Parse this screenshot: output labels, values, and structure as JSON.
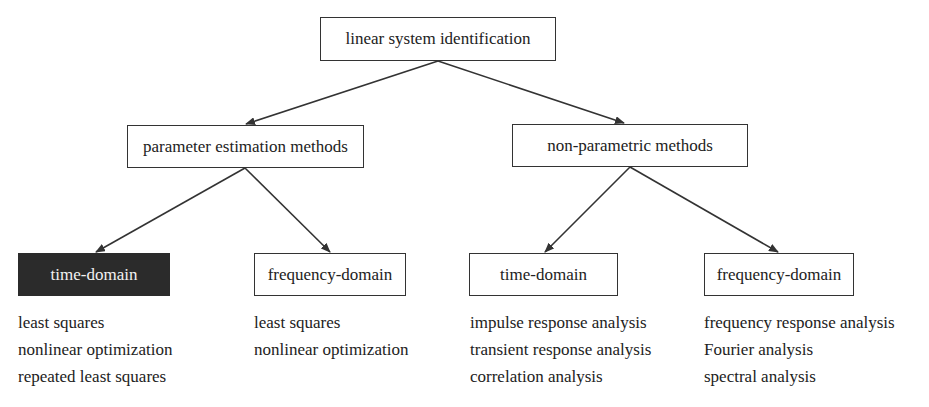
{
  "root": {
    "label": "linear system identification"
  },
  "categories": [
    {
      "label": "parameter estimation methods"
    },
    {
      "label": "non-parametric methods"
    }
  ],
  "leaves": [
    {
      "label": "time-domain",
      "highlighted": true,
      "items": [
        "least squares",
        "nonlinear optimization",
        "repeated least squares"
      ]
    },
    {
      "label": "frequency-domain",
      "highlighted": false,
      "items": [
        "least squares",
        "nonlinear optimization"
      ]
    },
    {
      "label": "time-domain",
      "highlighted": false,
      "items": [
        "impulse response analysis",
        "transient response analysis",
        "correlation analysis"
      ]
    },
    {
      "label": "frequency-domain",
      "highlighted": false,
      "items": [
        "frequency response analysis",
        "Fourier analysis",
        "spectral analysis"
      ]
    }
  ],
  "colors": {
    "line": "#333333",
    "highlight_fill": "#2b2b2b",
    "highlight_text": "#f2f2f2"
  }
}
